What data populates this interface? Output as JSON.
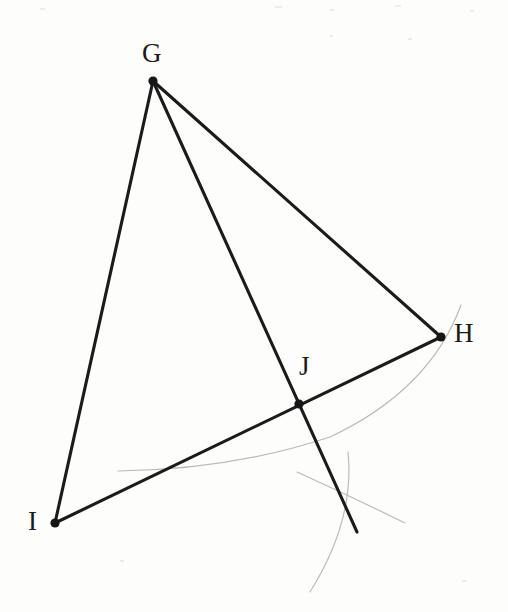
{
  "figure": {
    "background_color": "#fdfdfc",
    "stroke_color": "#1b1b1b",
    "construction_arc_color": "#b9b9b9",
    "width": 508,
    "height": 612
  },
  "points": [
    {
      "id": "G",
      "label": "G",
      "x": 153,
      "y": 81,
      "label_x": 142,
      "label_y": 40
    },
    {
      "id": "H",
      "label": "H",
      "x": 441,
      "y": 337,
      "label_x": 454,
      "label_y": 320
    },
    {
      "id": "I",
      "label": "I",
      "x": 55,
      "y": 523,
      "label_x": 28,
      "label_y": 508
    },
    {
      "id": "J",
      "label": "J",
      "x": 299,
      "y": 404,
      "label_x": 299,
      "label_y": 353
    }
  ],
  "segments": [
    {
      "id": "GH",
      "from": "G",
      "to": "H",
      "x1": 153,
      "y1": 81,
      "x2": 441,
      "y2": 337
    },
    {
      "id": "GI",
      "from": "G",
      "to": "I",
      "x1": 153,
      "y1": 81,
      "x2": 55,
      "y2": 523
    },
    {
      "id": "IH",
      "from": "I",
      "to": "H",
      "x1": 55,
      "y1": 523,
      "x2": 441,
      "y2": 337
    },
    {
      "id": "G-ext",
      "from": "G",
      "to": "extended-end",
      "x1": 153,
      "y1": 81,
      "x2": 357,
      "y2": 532
    }
  ],
  "construction_arcs": [
    {
      "id": "arc-large",
      "description": "long faint arc from near H sweeping down-left past J",
      "path": "M 461 305 Q 430 390 330 437 Q 230 470 118 471"
    },
    {
      "id": "arc-short-right",
      "description": "short faint arc crossing the extended cevian, opening right",
      "path": "M 297 472 Q 350 496 405 523"
    },
    {
      "id": "arc-short-down",
      "description": "short faint arc crossing the extended cevian, running downward",
      "path": "M 348 452 Q 355 520 310 592"
    }
  ],
  "labels": {
    "G": "G",
    "H": "H",
    "I": "I",
    "J": "J"
  }
}
